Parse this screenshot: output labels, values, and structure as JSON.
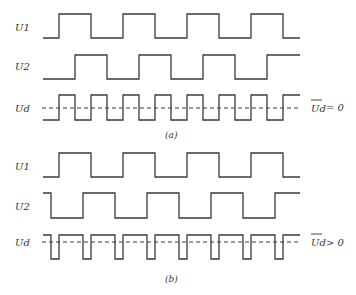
{
  "figure": {
    "panels": [
      {
        "caption": "(a)",
        "signals": [
          {
            "label": "U1",
            "high_y": 14,
            "low_y": 38,
            "start_x": 43,
            "end_x": 300,
            "start_level": "low",
            "edges": [
              59,
              91,
              123,
              155,
              187,
              219,
              251,
              283
            ]
          },
          {
            "label": "U2",
            "high_y": 55,
            "low_y": 79,
            "start_x": 43,
            "end_x": 300,
            "start_level": "low",
            "edges": [
              75,
              107,
              139,
              171,
              203,
              235,
              267
            ]
          },
          {
            "label": "Ud",
            "high_y": 95,
            "low_y": 120,
            "start_x": 43,
            "end_x": 300,
            "start_level": "low",
            "edges": [
              59,
              75,
              91,
              107,
              123,
              139,
              155,
              171,
              187,
              203,
              219,
              235,
              251,
              267,
              283
            ]
          }
        ],
        "mean_line": {
          "y": 108,
          "x1": 42,
          "x2": 300
        },
        "mean_label": {
          "symbol": "Ud",
          "relation": "= 0"
        }
      },
      {
        "caption": "(b)",
        "signals": [
          {
            "label": "U1",
            "high_y": 153,
            "low_y": 177,
            "start_x": 43,
            "end_x": 300,
            "start_level": "low",
            "edges": [
              59,
              91,
              123,
              155,
              187,
              219,
              251,
              283
            ]
          },
          {
            "label": "U2",
            "high_y": 193,
            "low_y": 218,
            "start_x": 43,
            "end_x": 300,
            "start_level": "high",
            "edges": [
              51,
              83,
              115,
              147,
              179,
              211,
              243,
              275
            ]
          },
          {
            "label": "Ud",
            "high_y": 235,
            "low_y": 259,
            "start_x": 43,
            "end_x": 300,
            "start_level": "high",
            "edges": [
              51,
              59,
              83,
              91,
              115,
              123,
              147,
              155,
              179,
              187,
              211,
              219,
              243,
              251,
              275,
              283
            ]
          }
        ],
        "mean_line": {
          "y": 242,
          "x1": 42,
          "x2": 300
        },
        "mean_label": {
          "symbol": "Ud",
          "relation": "> 0"
        }
      }
    ]
  },
  "labels": {
    "a_u1": "U1",
    "a_u2": "U2",
    "a_ud": "Ud",
    "a_mean_symbol": "Ud",
    "a_mean_rel": "= 0",
    "a_caption": "(a)",
    "b_u1": "U1",
    "b_u2": "U2",
    "b_ud": "Ud",
    "b_mean_symbol": "Ud",
    "b_mean_rel": "> 0",
    "b_caption": "(b)"
  }
}
